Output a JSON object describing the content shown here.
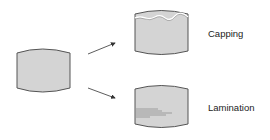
{
  "diagram": {
    "type": "tablet-defects",
    "nodes": [
      {
        "id": "intact-tablet",
        "label": ""
      },
      {
        "id": "capping-tablet",
        "label": "Capping"
      },
      {
        "id": "lamination-tablet",
        "label": "Lamination"
      }
    ],
    "edges": [
      {
        "from": "intact-tablet",
        "to": "capping-tablet"
      },
      {
        "from": "intact-tablet",
        "to": "lamination-tablet"
      }
    ],
    "labels": {
      "capping": "Capping",
      "lamination": "Lamination"
    },
    "colors": {
      "tablet_fill": "#d4d4d4",
      "tablet_stroke": "#555555",
      "arrow": "#333333",
      "crack": "#666666"
    }
  }
}
